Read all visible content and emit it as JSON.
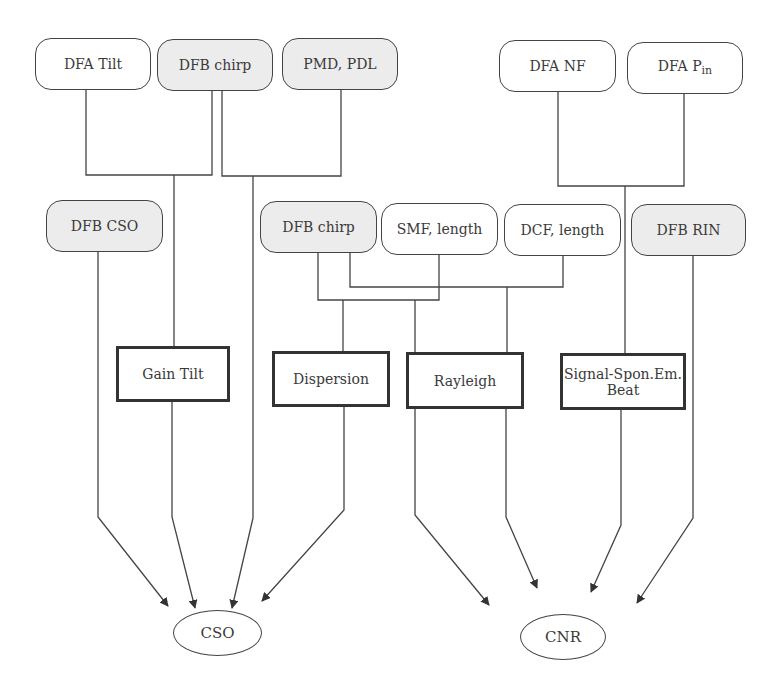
{
  "diagram": {
    "top_row": [
      {
        "id": "dfa-tilt",
        "label": "DFA Tilt",
        "shaded": false
      },
      {
        "id": "dfb-chirp-top",
        "label": "DFB chirp",
        "shaded": true
      },
      {
        "id": "pmd-pdl",
        "label": "PMD, PDL",
        "shaded": true
      },
      {
        "id": "dfa-nf",
        "label": "DFA NF",
        "shaded": false
      },
      {
        "id": "dfa-pin",
        "label": "DFA P",
        "label_sub": "in",
        "shaded": false
      }
    ],
    "middle_row": [
      {
        "id": "dfb-cso",
        "label": "DFB CSO",
        "shaded": true
      },
      {
        "id": "dfb-chirp-mid",
        "label": "DFB chirp",
        "shaded": true
      },
      {
        "id": "smf-length",
        "label": "SMF, length",
        "shaded": false
      },
      {
        "id": "dcf-length",
        "label": "DCF, length",
        "shaded": false
      },
      {
        "id": "dfb-rin",
        "label": "DFB RIN",
        "shaded": true
      }
    ],
    "mechanisms": [
      {
        "id": "gain-tilt",
        "label": "Gain Tilt"
      },
      {
        "id": "dispersion",
        "label": "Dispersion"
      },
      {
        "id": "rayleigh",
        "label": "Rayleigh"
      },
      {
        "id": "signal-spon-em-beat",
        "label": "Signal-Spon.Em. Beat",
        "line1": "Signal-Spon.Em.",
        "line2": "Beat"
      }
    ],
    "outputs": [
      {
        "id": "cso",
        "label": "CSO"
      },
      {
        "id": "cnr",
        "label": "CNR"
      }
    ],
    "edges": [
      {
        "from": [
          "DFA Tilt",
          "DFB chirp"
        ],
        "to": "Gain Tilt"
      },
      {
        "from": [
          "DFB chirp",
          "PMD, PDL"
        ],
        "to": "CSO"
      },
      {
        "from": [
          "DFA NF",
          "DFA Pin"
        ],
        "to": "Signal-Spon.Em. Beat"
      },
      {
        "from": [
          "DFB chirp",
          "SMF, length"
        ],
        "to": "Dispersion"
      },
      {
        "from": [
          "DFB chirp",
          "DCF, length"
        ],
        "to": "Rayleigh"
      },
      {
        "from": [
          "DFB CSO"
        ],
        "to": "CSO"
      },
      {
        "from": [
          "Gain Tilt"
        ],
        "to": "CSO"
      },
      {
        "from": [
          "Dispersion"
        ],
        "to": "CSO"
      },
      {
        "from": [
          "Rayleigh"
        ],
        "to": "CNR"
      },
      {
        "from": [
          "SMF/DCF junction"
        ],
        "to": "CNR"
      },
      {
        "from": [
          "Signal-Spon.Em. Beat"
        ],
        "to": "CNR"
      },
      {
        "from": [
          "DFB RIN"
        ],
        "to": "CNR"
      }
    ],
    "colors": {
      "line": "#444444",
      "shaded_fill": "#ececec",
      "background": "#ffffff"
    }
  }
}
